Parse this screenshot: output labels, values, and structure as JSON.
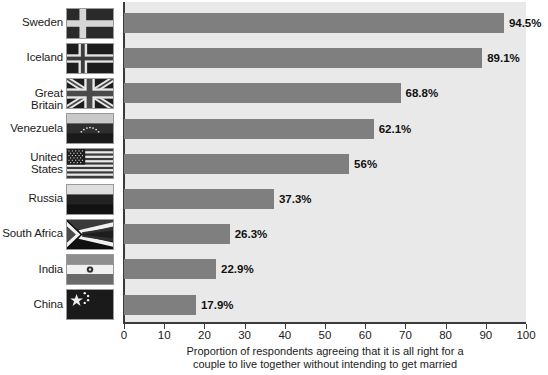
{
  "chart_data": {
    "type": "bar",
    "orientation": "horizontal",
    "title": "",
    "subtitle": "",
    "xlabel_line1": "Proportion of respondents agreeing that it is all right for a",
    "xlabel_line2": "couple to live together without intending to get married",
    "ylabel": "",
    "categories": [
      "Sweden",
      "Iceland",
      "Great Britain",
      "Venezuela",
      "United States",
      "Russia",
      "South Africa",
      "India",
      "China"
    ],
    "values": [
      94.5,
      89.1,
      68.8,
      62.1,
      56,
      37.3,
      26.3,
      22.9,
      17.9
    ],
    "value_labels": [
      "94.5%",
      "89.1%",
      "68.8%",
      "62.1%",
      "56%",
      "37.3%",
      "26.3%",
      "22.9%",
      "17.9%"
    ],
    "xlim": [
      0,
      100
    ],
    "xticks": [
      0,
      10,
      20,
      30,
      40,
      50,
      60,
      70,
      80,
      90,
      100
    ],
    "xtick_labels": [
      "0",
      "10",
      "20",
      "30",
      "40",
      "50",
      "60",
      "70",
      "80",
      "90",
      "100"
    ],
    "grid": false,
    "legend": null,
    "bar_color": "#7f7f7f",
    "plot_background": "#e9e9e9",
    "axis_color": "#3a3a3a",
    "label_color": "#1b1b1b"
  },
  "rows": [
    {
      "country": "Sweden",
      "label_lines": [
        "Sweden"
      ],
      "value_label": "94.5%",
      "value": 94.5,
      "flag": "flag-sweden"
    },
    {
      "country": "Iceland",
      "label_lines": [
        "Iceland"
      ],
      "value_label": "89.1%",
      "value": 89.1,
      "flag": "flag-iceland"
    },
    {
      "country": "Great Britain",
      "label_lines": [
        "Great Britain"
      ],
      "value_label": "68.8%",
      "value": 68.8,
      "flag": "flag-great-britain"
    },
    {
      "country": "Venezuela",
      "label_lines": [
        "Venezuela"
      ],
      "value_label": "62.1%",
      "value": 62.1,
      "flag": "flag-venezuela"
    },
    {
      "country": "United States",
      "label_lines": [
        "United",
        "States"
      ],
      "value_label": "56%",
      "value": 56,
      "flag": "flag-united-states"
    },
    {
      "country": "Russia",
      "label_lines": [
        "Russia"
      ],
      "value_label": "37.3%",
      "value": 37.3,
      "flag": "flag-russia"
    },
    {
      "country": "South Africa",
      "label_lines": [
        "South Africa"
      ],
      "value_label": "26.3%",
      "value": 26.3,
      "flag": "flag-south-africa"
    },
    {
      "country": "India",
      "label_lines": [
        "India"
      ],
      "value_label": "22.9%",
      "value": 22.9,
      "flag": "flag-india"
    },
    {
      "country": "China",
      "label_lines": [
        "China"
      ],
      "value_label": "17.9%",
      "value": 17.9,
      "flag": "flag-china"
    }
  ]
}
